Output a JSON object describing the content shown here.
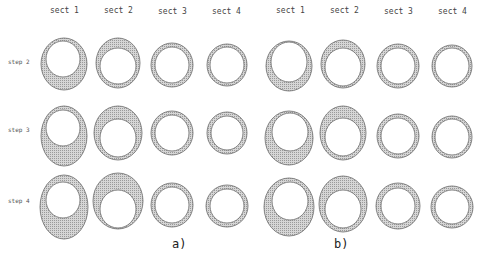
{
  "figure": {
    "columns": [
      "sect 1",
      "sect 2",
      "sect 3",
      "sect 4"
    ],
    "rows": [
      "step 2",
      "step 3",
      "step 4"
    ],
    "panels": [
      {
        "caption": "a)",
        "x_offset": 0
      },
      {
        "caption": "b)",
        "x_offset": 218
      }
    ],
    "colors": {
      "fill": "#bdbdbd",
      "stroke": "#6a6a6a",
      "inner": "#ffffff"
    }
  }
}
